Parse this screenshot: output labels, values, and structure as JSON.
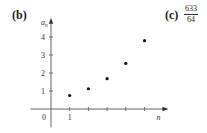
{
  "part_labels": {
    "b": "(b)",
    "c": "(c)"
  },
  "answer_c": {
    "numerator": "633",
    "denominator": "64"
  },
  "chart_data": {
    "type": "scatter",
    "title": "",
    "xlabel": "n",
    "ylabel": "a_n",
    "ylabel_main": "a",
    "ylabel_sub": "n",
    "origin_label": "0",
    "x": [
      1,
      2,
      3,
      4,
      5
    ],
    "values": [
      0.75,
      1.125,
      1.6875,
      2.53125,
      3.796875
    ],
    "xlim": [
      0,
      5.8
    ],
    "ylim": [
      -0.9,
      4.9
    ],
    "x_ticks": [
      1,
      2,
      3,
      4,
      5
    ],
    "x_tick_labels": [
      "1",
      "",
      "",
      "",
      ""
    ],
    "y_ticks": [
      1,
      2,
      3,
      4
    ],
    "y_tick_labels": [
      "1",
      "2",
      "3",
      "4"
    ],
    "grid": false,
    "legend": "none"
  }
}
